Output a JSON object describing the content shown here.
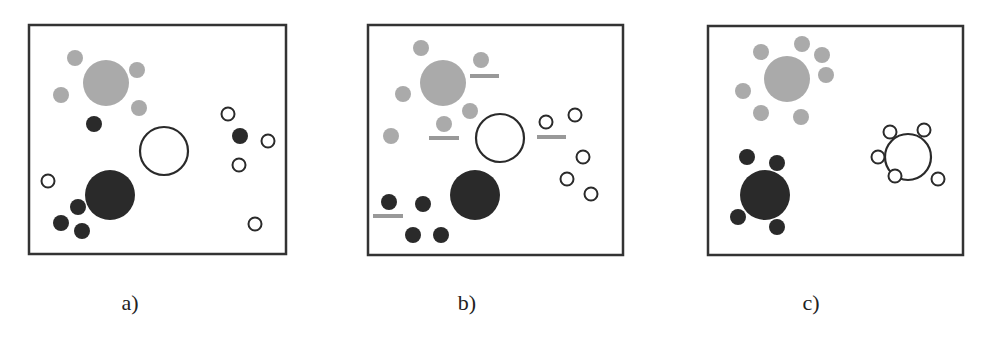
{
  "colors": {
    "border": "#333333",
    "gray_fill": "#aaaaaa",
    "dark_fill": "#2a2a2a",
    "white_fill": "#ffffff",
    "outline": "#2a2a2a",
    "bar": "#999999"
  },
  "panels": [
    {
      "label": "a)",
      "label_pos": [
        130,
        304
      ],
      "frame": [
        29,
        25,
        257,
        229
      ],
      "large": [
        {
          "type": "gray",
          "cx": 106,
          "cy": 83,
          "r": 23
        },
        {
          "type": "white",
          "cx": 164,
          "cy": 151,
          "r": 24
        },
        {
          "type": "dark",
          "cx": 110,
          "cy": 195,
          "r": 25
        }
      ],
      "small": [
        {
          "type": "gray",
          "cx": 75,
          "cy": 58
        },
        {
          "type": "gray",
          "cx": 137,
          "cy": 70
        },
        {
          "type": "gray",
          "cx": 61,
          "cy": 95
        },
        {
          "type": "gray",
          "cx": 139,
          "cy": 108
        },
        {
          "type": "dark",
          "cx": 94,
          "cy": 124
        },
        {
          "type": "white",
          "cx": 48,
          "cy": 181
        },
        {
          "type": "dark",
          "cx": 78,
          "cy": 207
        },
        {
          "type": "dark",
          "cx": 61,
          "cy": 223
        },
        {
          "type": "dark",
          "cx": 82,
          "cy": 231
        },
        {
          "type": "white",
          "cx": 228,
          "cy": 114
        },
        {
          "type": "dark",
          "cx": 240,
          "cy": 136
        },
        {
          "type": "white",
          "cx": 268,
          "cy": 141
        },
        {
          "type": "white",
          "cx": 239,
          "cy": 165
        },
        {
          "type": "white",
          "cx": 255,
          "cy": 224
        }
      ],
      "bars": []
    },
    {
      "label": "b)",
      "label_pos": [
        467,
        304
      ],
      "frame": [
        368,
        25,
        255,
        230
      ],
      "large": [
        {
          "type": "gray",
          "cx": 443,
          "cy": 83,
          "r": 23
        },
        {
          "type": "white",
          "cx": 500,
          "cy": 138,
          "r": 24
        },
        {
          "type": "dark",
          "cx": 475,
          "cy": 195,
          "r": 25
        }
      ],
      "small": [
        {
          "type": "gray",
          "cx": 421,
          "cy": 48
        },
        {
          "type": "gray",
          "cx": 481,
          "cy": 60
        },
        {
          "type": "gray",
          "cx": 403,
          "cy": 94
        },
        {
          "type": "gray",
          "cx": 470,
          "cy": 111
        },
        {
          "type": "gray",
          "cx": 444,
          "cy": 124
        },
        {
          "type": "gray",
          "cx": 391,
          "cy": 136
        },
        {
          "type": "white",
          "cx": 546,
          "cy": 122
        },
        {
          "type": "white",
          "cx": 575,
          "cy": 115
        },
        {
          "type": "white",
          "cx": 583,
          "cy": 157
        },
        {
          "type": "white",
          "cx": 567,
          "cy": 179
        },
        {
          "type": "white",
          "cx": 591,
          "cy": 194
        },
        {
          "type": "dark",
          "cx": 389,
          "cy": 202
        },
        {
          "type": "dark",
          "cx": 423,
          "cy": 204
        },
        {
          "type": "dark",
          "cx": 413,
          "cy": 235
        },
        {
          "type": "dark",
          "cx": 441,
          "cy": 235
        }
      ],
      "bars": [
        {
          "x": 470,
          "y": 76,
          "w": 29
        },
        {
          "x": 429,
          "y": 138,
          "w": 30
        },
        {
          "x": 537,
          "y": 137,
          "w": 29
        },
        {
          "x": 373,
          "y": 216,
          "w": 30
        }
      ]
    },
    {
      "label": "c)",
      "label_pos": [
        811,
        304
      ],
      "frame": [
        708,
        26,
        255,
        229
      ],
      "large": [
        {
          "type": "gray",
          "cx": 787,
          "cy": 79,
          "r": 23
        },
        {
          "type": "white",
          "cx": 908,
          "cy": 157,
          "r": 23
        },
        {
          "type": "dark",
          "cx": 765,
          "cy": 195,
          "r": 25
        }
      ],
      "small": [
        {
          "type": "gray",
          "cx": 761,
          "cy": 52
        },
        {
          "type": "gray",
          "cx": 802,
          "cy": 44
        },
        {
          "type": "gray",
          "cx": 822,
          "cy": 55
        },
        {
          "type": "gray",
          "cx": 826,
          "cy": 75
        },
        {
          "type": "gray",
          "cx": 743,
          "cy": 91
        },
        {
          "type": "gray",
          "cx": 761,
          "cy": 113
        },
        {
          "type": "gray",
          "cx": 801,
          "cy": 117
        },
        {
          "type": "white",
          "cx": 890,
          "cy": 132
        },
        {
          "type": "white",
          "cx": 924,
          "cy": 130
        },
        {
          "type": "white",
          "cx": 878,
          "cy": 157
        },
        {
          "type": "white",
          "cx": 895,
          "cy": 176
        },
        {
          "type": "white",
          "cx": 938,
          "cy": 179
        },
        {
          "type": "dark",
          "cx": 747,
          "cy": 157
        },
        {
          "type": "dark",
          "cx": 777,
          "cy": 163
        },
        {
          "type": "dark",
          "cx": 738,
          "cy": 217
        },
        {
          "type": "dark",
          "cx": 777,
          "cy": 227
        }
      ],
      "bars": []
    }
  ]
}
